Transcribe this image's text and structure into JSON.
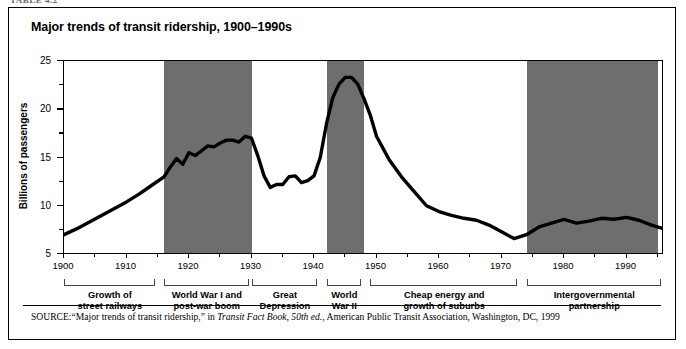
{
  "page": {
    "cropped_header": "TABLE 4.2"
  },
  "figure": {
    "title": "Major trends of transit ridership, 1900–1990s",
    "source": {
      "label": "SOURCE:",
      "quoted_title": "“Major trends of transit ridership,” in ",
      "italic_book": "Transit Fact Book, 50th ed.",
      "tail": ", American Public Transit Association, Washington, DC, 1999"
    }
  },
  "chart_data": {
    "type": "line",
    "title": "Major trends of transit ridership, 1900–1990s",
    "xlabel": "",
    "ylabel": "Billions of passengers",
    "xlim": [
      1900,
      1996
    ],
    "ylim": [
      5,
      25
    ],
    "grid": false,
    "legend": "none",
    "x_ticks_major": [
      1900,
      1910,
      1920,
      1930,
      1940,
      1950,
      1960,
      1970,
      1980,
      1990
    ],
    "x_ticks_minor": [
      1905,
      1915,
      1925,
      1935,
      1945,
      1955,
      1965,
      1975,
      1985,
      1995
    ],
    "y_ticks_major": [
      5,
      10,
      15,
      20,
      25
    ],
    "y_ticks_minor": [
      7.5,
      12.5,
      17.5,
      22.5
    ],
    "line_color": "#000000",
    "band_color": "#6e6e6e",
    "x": [
      1900,
      1902,
      1904,
      1906,
      1908,
      1910,
      1912,
      1914,
      1916,
      1917,
      1918,
      1919,
      1920,
      1921,
      1922,
      1923,
      1924,
      1925,
      1926,
      1927,
      1928,
      1929,
      1930,
      1931,
      1932,
      1933,
      1934,
      1935,
      1936,
      1937,
      1938,
      1939,
      1940,
      1941,
      1942,
      1943,
      1944,
      1945,
      1946,
      1947,
      1948,
      1949,
      1950,
      1952,
      1954,
      1956,
      1958,
      1960,
      1962,
      1964,
      1966,
      1968,
      1970,
      1972,
      1974,
      1976,
      1978,
      1980,
      1982,
      1984,
      1986,
      1988,
      1990,
      1992,
      1994,
      1996
    ],
    "values": [
      7.0,
      7.6,
      8.3,
      9.0,
      9.7,
      10.4,
      11.2,
      12.1,
      13.0,
      14.0,
      14.9,
      14.3,
      15.5,
      15.2,
      15.7,
      16.2,
      16.1,
      16.5,
      16.8,
      16.8,
      16.6,
      17.2,
      17.0,
      15.2,
      13.1,
      11.9,
      12.2,
      12.2,
      13.0,
      13.1,
      12.4,
      12.6,
      13.1,
      15.0,
      18.5,
      21.2,
      22.6,
      23.3,
      23.3,
      22.6,
      21.1,
      19.4,
      17.2,
      14.8,
      13.0,
      11.5,
      10.0,
      9.4,
      9.0,
      8.7,
      8.5,
      8.0,
      7.3,
      6.6,
      7.0,
      7.8,
      8.2,
      8.6,
      8.2,
      8.4,
      8.7,
      8.6,
      8.8,
      8.5,
      8.0,
      7.6
    ],
    "shaded_bands": [
      {
        "name": "World War I and post-war boom",
        "start": 1916,
        "end": 1930
      },
      {
        "name": "World War II",
        "start": 1942,
        "end": 1948
      },
      {
        "name": "Intergovernmental partnership",
        "start": 1974,
        "end": 1995
      }
    ],
    "era_brackets": [
      {
        "label": "Growth of\nstreet railways",
        "line1": "Growth of",
        "line2": "street railways",
        "start": 1900,
        "end": 1915
      },
      {
        "label": "World War I and\npost-war boom",
        "line1": "World War I and",
        "line2": "post-war boom",
        "start": 1916,
        "end": 1930
      },
      {
        "label": "Great\nDepression",
        "line1": "Great",
        "line2": "Depression",
        "start": 1930,
        "end": 1941
      },
      {
        "label": "World\nWar II",
        "line1": "World",
        "line2": "War II",
        "start": 1942,
        "end": 1948
      },
      {
        "label": "Cheap energy and\ngrowth of suburbs",
        "line1": "Cheap energy and",
        "line2": "growth of suburbs",
        "start": 1949,
        "end": 1973
      },
      {
        "label": "Intergovernmental\npartnership",
        "line1": "Intergovernmental",
        "line2": "partnership",
        "start": 1974,
        "end": 1996
      }
    ]
  }
}
